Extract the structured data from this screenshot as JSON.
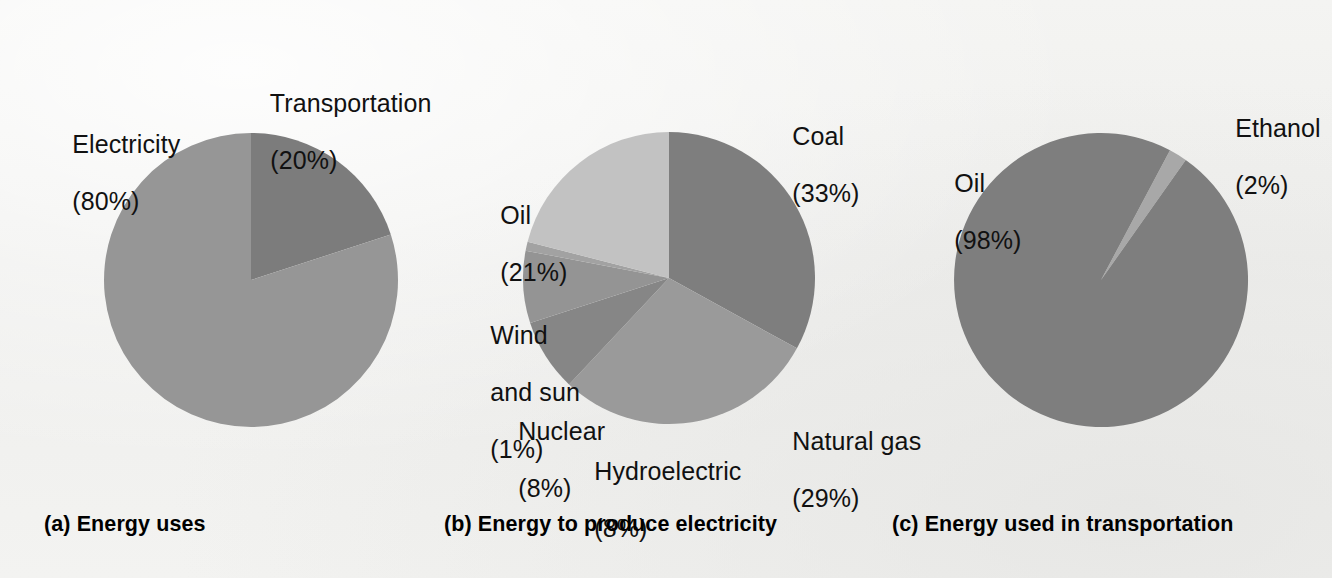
{
  "figure": {
    "background_color": "#f2f2f0",
    "text_color": "#111111"
  },
  "panels": [
    {
      "id": "a",
      "caption": "(a) Energy uses",
      "center": {
        "x": 251,
        "y": 280
      },
      "radius": 147
    },
    {
      "id": "b",
      "caption": "(b) Energy to produce electricity",
      "center": {
        "x": 669,
        "y": 278
      },
      "radius": 146
    },
    {
      "id": "c",
      "caption": "(c) Energy used in transportation",
      "center": {
        "x": 1101,
        "y": 280
      },
      "radius": 147
    }
  ],
  "chart_data": [
    {
      "type": "pie",
      "title": "(a) Energy uses",
      "start_angle_deg": 0,
      "direction": "clockwise",
      "categories": [
        "Transportation",
        "Electricity"
      ],
      "values": [
        20,
        80
      ],
      "value_labels": [
        "(20%)",
        "(80%)"
      ],
      "colors": [
        "#7c7c7c",
        "#969696"
      ],
      "labels": [
        {
          "name": "Transportation",
          "percent": "(20%)",
          "value": 20,
          "color": "#7c7c7c"
        },
        {
          "name": "Electricity",
          "percent": "(80%)",
          "value": 80,
          "color": "#969696"
        }
      ]
    },
    {
      "type": "pie",
      "title": "(b) Energy to produce electricity",
      "start_angle_deg": 0,
      "direction": "clockwise",
      "categories": [
        "Coal",
        "Natural gas",
        "Hydroelectric",
        "Nuclear",
        "Wind and sun",
        "Oil"
      ],
      "values": [
        33,
        29,
        8,
        8,
        1,
        21
      ],
      "value_labels": [
        "(33%)",
        "(29%)",
        "(8%)",
        "(8%)",
        "(1%)",
        "(21%)"
      ],
      "colors": [
        "#7e7e7e",
        "#9a9a9a",
        "#868686",
        "#949494",
        "#a2a2a2",
        "#c2c2c2"
      ],
      "labels": [
        {
          "name": "Coal",
          "percent": "(33%)",
          "value": 33,
          "color": "#7e7e7e"
        },
        {
          "name": "Natural gas",
          "percent": "(29%)",
          "value": 29,
          "color": "#9a9a9a"
        },
        {
          "name": "Hydroelectric",
          "percent": "(8%)",
          "value": 8,
          "color": "#868686"
        },
        {
          "name": "Nuclear",
          "percent": "(8%)",
          "value": 8,
          "color": "#949494"
        },
        {
          "name": "Wind and sun",
          "percent": "(1%)",
          "value": 1,
          "color": "#a2a2a2"
        },
        {
          "name": "Oil",
          "percent": "(21%)",
          "value": 21,
          "color": "#c2c2c2"
        }
      ]
    },
    {
      "type": "pie",
      "title": "(c) Energy used in transportation",
      "start_angle_deg": 28,
      "direction": "clockwise",
      "categories": [
        "Ethanol",
        "Oil"
      ],
      "values": [
        2,
        98
      ],
      "value_labels": [
        "(2%)",
        "(98%)"
      ],
      "colors": [
        "#a8a8a8",
        "#7e7e7e"
      ],
      "labels": [
        {
          "name": "Ethanol",
          "percent": "(2%)",
          "value": 2,
          "color": "#a8a8a8"
        },
        {
          "name": "Oil",
          "percent": "(98%)",
          "value": 98,
          "color": "#7e7e7e"
        }
      ]
    }
  ],
  "annotations": {
    "a": {
      "transportation_name": "Transportation",
      "transportation_pct": "(20%)",
      "electricity_name": "Electricity",
      "electricity_pct": "(80%)"
    },
    "b": {
      "coal_name": "Coal",
      "coal_pct": "(33%)",
      "oil_name": "Oil",
      "oil_pct": "(21%)",
      "wind_name_line1": "Wind",
      "wind_name_line2": "and sun",
      "wind_pct": "(1%)",
      "nuclear_name": "Nuclear",
      "nuclear_pct": "(8%)",
      "hydro_name": "Hydroelectric",
      "hydro_pct": "(8%)",
      "gas_name": "Natural gas",
      "gas_pct": "(29%)"
    },
    "c": {
      "ethanol_name": "Ethanol",
      "ethanol_pct": "(2%)",
      "oil_name": "Oil",
      "oil_pct": "(98%)"
    }
  },
  "captions": {
    "a": "(a) Energy uses",
    "b": "(b) Energy to produce electricity",
    "c": "(c) Energy used in transportation"
  }
}
